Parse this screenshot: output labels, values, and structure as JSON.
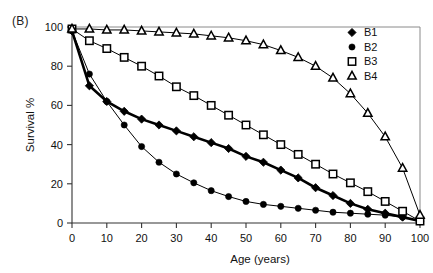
{
  "figure": {
    "panel_label": "(B)"
  },
  "chart_data": {
    "type": "line",
    "title": "",
    "xlabel": "Age (years)",
    "ylabel": "Survival  %",
    "xlim": [
      0,
      100
    ],
    "ylim": [
      0,
      100
    ],
    "xticks": [
      0,
      10,
      20,
      30,
      40,
      50,
      60,
      70,
      80,
      90,
      100
    ],
    "yticks": [
      0,
      20,
      40,
      60,
      80,
      100
    ],
    "xtick_labels": [
      "0",
      "10",
      "20",
      "30",
      "40",
      "50",
      "60",
      "70",
      "80",
      "90",
      "100"
    ],
    "ytick_labels": [
      "0",
      "20",
      "40",
      "60",
      "80",
      "100"
    ],
    "grid": false,
    "legend_position": "top-right",
    "x": [
      0,
      5,
      10,
      15,
      20,
      25,
      30,
      35,
      40,
      45,
      50,
      55,
      60,
      65,
      70,
      75,
      80,
      85,
      90,
      95,
      100
    ],
    "series": [
      {
        "name": "B1",
        "marker": "filled-diamond",
        "values": [
          98,
          70,
          62,
          57,
          53,
          50,
          47,
          44,
          41,
          38,
          34,
          31,
          27,
          23,
          18,
          14,
          10,
          7,
          5,
          3,
          1
        ]
      },
      {
        "name": "B2",
        "marker": "filled-circle",
        "values": [
          98,
          76,
          62,
          50,
          39,
          31,
          25,
          20.5,
          16.5,
          13.5,
          11,
          9.5,
          8.5,
          7.5,
          6.5,
          5.5,
          5,
          4.5,
          4,
          3,
          1
        ]
      },
      {
        "name": "B3",
        "marker": "open-square",
        "values": [
          99,
          93,
          89,
          84.5,
          80,
          75,
          69.5,
          65,
          60,
          55,
          50,
          45,
          40,
          35,
          30,
          25,
          20.5,
          16,
          11,
          6,
          1
        ]
      },
      {
        "name": "B4",
        "marker": "open-triangle",
        "values": [
          99,
          99,
          98.5,
          98.5,
          98,
          97.5,
          97,
          96.5,
          95.5,
          94.5,
          93,
          91,
          88,
          84.5,
          80,
          74,
          66,
          56,
          44,
          28,
          4
        ]
      }
    ],
    "legend": [
      {
        "label": "B1",
        "marker": "filled-diamond"
      },
      {
        "label": "B2",
        "marker": "filled-circle"
      },
      {
        "label": "B3",
        "marker": "open-square"
      },
      {
        "label": "B4",
        "marker": "open-triangle"
      }
    ],
    "colors": {
      "series": "#000000",
      "axis": "#333333",
      "frame": "#8a8a8a",
      "background": "#ffffff"
    }
  }
}
